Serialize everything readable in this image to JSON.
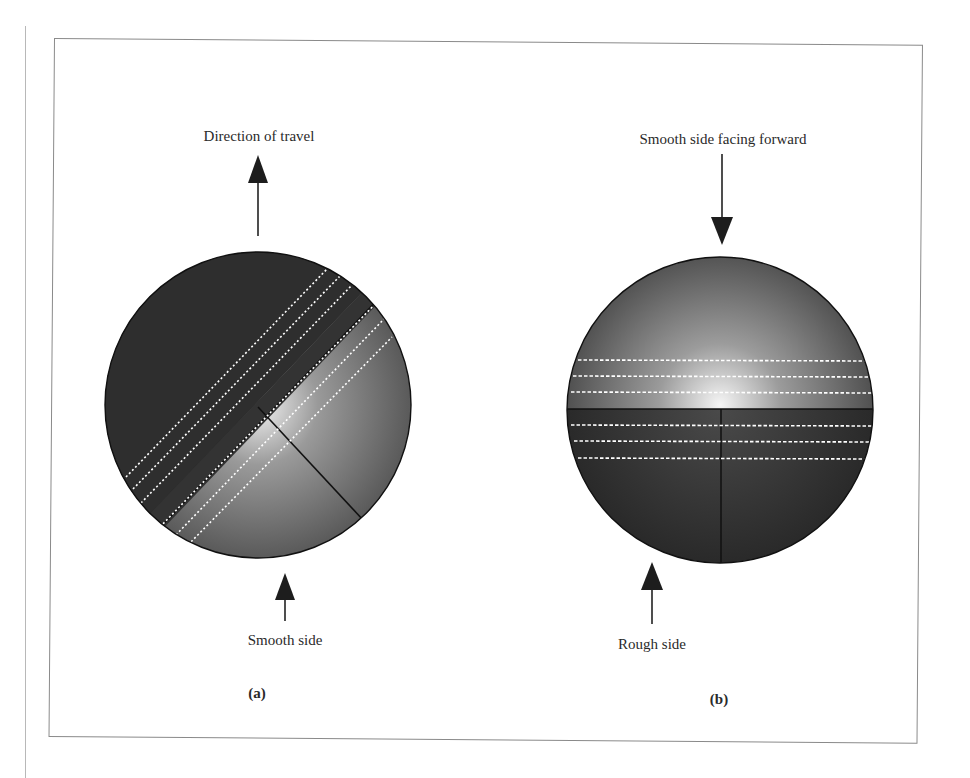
{
  "figure": {
    "panels": [
      {
        "id": "a",
        "caption": "(a)",
        "top_label": "Direction of travel",
        "bottom_label": "Smooth side",
        "top_arrow_direction": "up",
        "bottom_arrow_direction": "up",
        "seam_orientation": "diagonal",
        "colors": {
          "dark_half": "#2f2f2f",
          "light_half_center": "#f2f2f2",
          "light_half_edge": "#5a5a5a",
          "seam_dashes": "#ffffff"
        }
      },
      {
        "id": "b",
        "caption": "(b)",
        "top_label": "Smooth side facing forward",
        "bottom_label": "Rough side",
        "top_arrow_direction": "down",
        "bottom_arrow_direction": "up",
        "seam_orientation": "horizontal",
        "colors": {
          "dark_half": "#2f2f2f",
          "light_half_center": "#f4f4f4",
          "light_half_edge": "#4a4a4a",
          "seam_dashes": "#ffffff"
        }
      }
    ]
  }
}
